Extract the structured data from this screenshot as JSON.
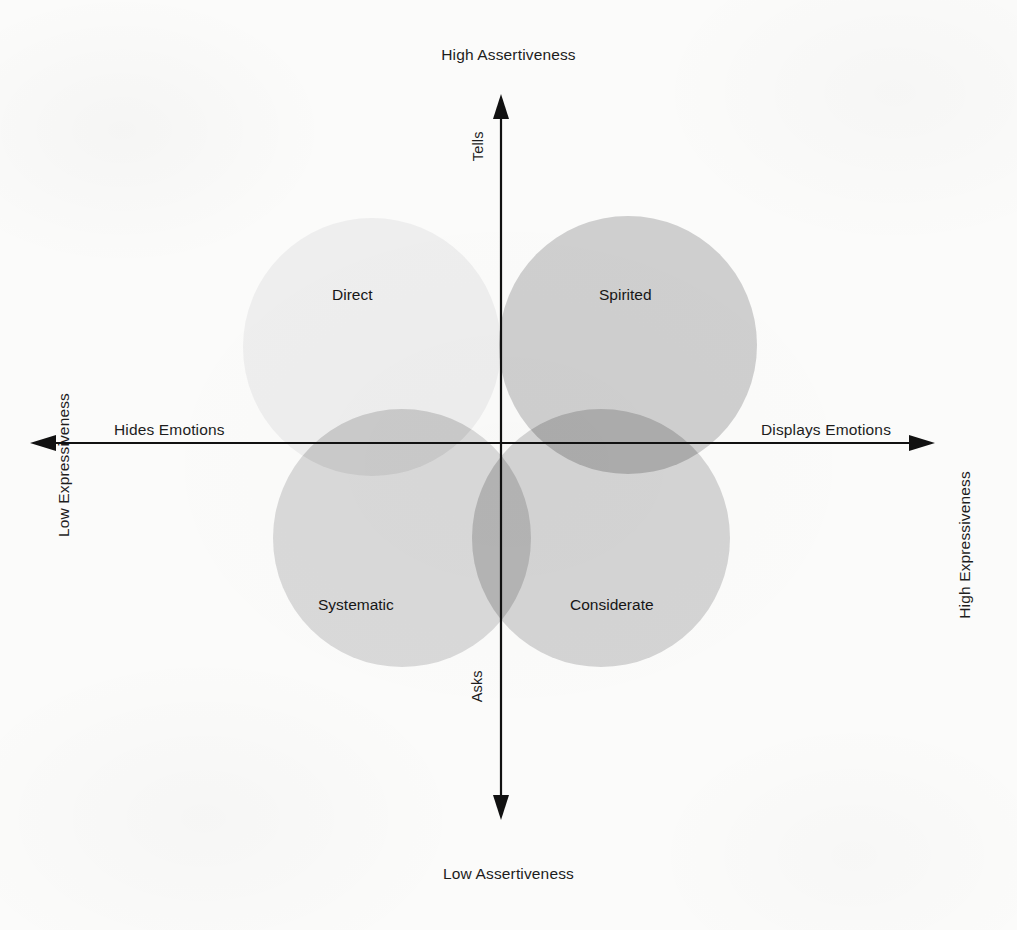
{
  "diagram": {
    "type": "quadrant-venn",
    "background_color": "#fbfbfa",
    "text_color": "#1d1d1d"
  },
  "axes": {
    "vertical": {
      "top_pole_label": "High Assertiveness",
      "bottom_pole_label": "Low Assertiveness",
      "top_inner_label": "Tells",
      "bottom_inner_label": "Asks",
      "arrow_both_ends": true,
      "color": "#111111"
    },
    "horizontal": {
      "left_pole_label": "Hides Emotions",
      "right_pole_label": "Displays Emotions",
      "left_outer_label": "Low Expressiveness",
      "right_outer_label": "High Expressiveness",
      "arrow_both_ends": true,
      "color": "#111111"
    }
  },
  "chart_data": {
    "type": "scatter",
    "xlabel": "Expressiveness",
    "ylabel": "Assertiveness",
    "quadrants": [
      {
        "name": "Direct",
        "assertiveness": "High",
        "expressiveness": "Low",
        "quadrant": "top-left",
        "center_x": 372,
        "center_y": 347,
        "radius": 129,
        "fill": "#eeeeee"
      },
      {
        "name": "Spirited",
        "assertiveness": "High",
        "expressiveness": "High",
        "quadrant": "top-right",
        "center_x": 628,
        "center_y": 345,
        "radius": 129,
        "fill": "#cfcfcf"
      },
      {
        "name": "Systematic",
        "assertiveness": "Low",
        "expressiveness": "Low",
        "quadrant": "bottom-left",
        "center_x": 402,
        "center_y": 538,
        "radius": 129,
        "fill": "#d9d9d9"
      },
      {
        "name": "Considerate",
        "assertiveness": "Low",
        "expressiveness": "High",
        "quadrant": "bottom-right",
        "center_x": 601,
        "center_y": 538,
        "radius": 129,
        "fill": "#d4d4d4"
      }
    ]
  },
  "labels": {
    "high_assertiveness": "High Assertiveness",
    "low_assertiveness": "Low Assertiveness",
    "hides_emotions": "Hides Emotions",
    "displays_emotions": "Displays Emotions",
    "low_expressiveness": "Low Expressiveness",
    "high_expressiveness": "High Expressiveness",
    "tells": "Tells",
    "asks": "Asks",
    "direct": "Direct",
    "spirited": "Spirited",
    "systematic": "Systematic",
    "considerate": "Considerate"
  }
}
